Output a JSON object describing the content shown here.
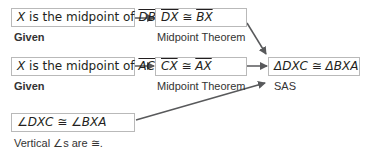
{
  "statements": [
    {
      "id": "s1",
      "prefix_var": "X",
      "text": " is the midpoint of ",
      "segment": "DB",
      "suffix": ".",
      "reason": "Given"
    },
    {
      "id": "s2",
      "left": "DX",
      "op": " ≅ ",
      "right": "BX",
      "reason": "Midpoint Theorem"
    },
    {
      "id": "s3",
      "prefix_var": "X",
      "text": " is the midpoint of ",
      "segment": "AC",
      "suffix": ".",
      "reason": "Given"
    },
    {
      "id": "s4",
      "left": "CX",
      "op": " ≅ ",
      "right": "AX",
      "reason": "Midpoint Theorem"
    },
    {
      "id": "s5",
      "text": "∠DXC ≅ ∠BXA",
      "reason": "Vertical ∠s are ≅."
    },
    {
      "id": "s6",
      "text": "ΔDXC ≅ ΔBXA",
      "reason": "SAS"
    }
  ],
  "colors": {
    "box_border": "#b9b9b9",
    "arrow": "#58595b",
    "text": "#231f20"
  }
}
